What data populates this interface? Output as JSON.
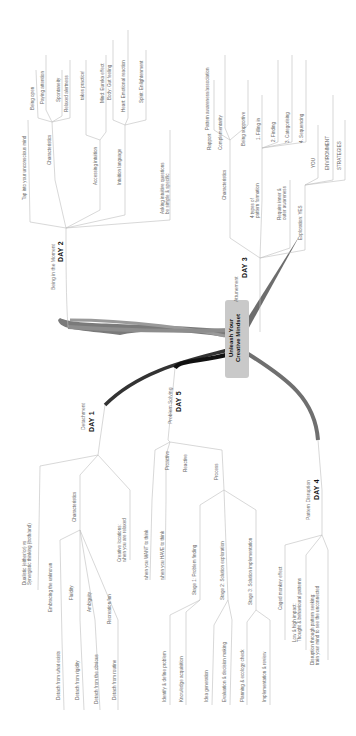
{
  "title": "Unleash Your\nCreative Mindset",
  "colors": {
    "branch_dark": "#222222",
    "branch_mid": "#6b6b6b",
    "line": "#bdbdbd",
    "center_fill": "#c9c9c9"
  },
  "branches": {
    "day2": {
      "day": "DAY 2",
      "topic": "Being in the Moment",
      "children": {
        "tap": "Tap into your unconscious mind",
        "characteristics": "Characteristics",
        "char_items": [
          "Being open",
          "Paying attention",
          "Spontaneity",
          "Relaxed alertness"
        ],
        "accessing": "Accessing intuition",
        "access_items": [
          "takes practice!",
          "Mind: Eureka effect"
        ],
        "language": "Intuition language",
        "lang_items": [
          "Body: Gut feeling",
          "Heart: Emotional reaction",
          "Spirit: Enlightenment"
        ],
        "asking": "Asking intuitive questions\nbe simple & specific"
      }
    },
    "day3": {
      "day": "DAY 3",
      "topic": "Attunement",
      "children": {
        "pattern": "Pattern awareness/association",
        "characteristics": "Characteristics",
        "char_items": [
          "Rapport",
          "Complementarity",
          "Being supportive"
        ],
        "types": "4 types of\npattern formation",
        "type_items": [
          "1. Filling in",
          "2. Finding",
          "3. Categorising",
          "4. Sequencing"
        ],
        "require": "Require inner &\nouter awareness",
        "exploration": "Exploration: YES",
        "explore_items": [
          "YOU",
          "ENVIRONMENT",
          "STRATEGIES"
        ]
      }
    },
    "day1": {
      "day": "DAY 1",
      "topic": "Detachment",
      "children": {
        "dualistic": "Dualistic (either/or) vs\nSynergistic thinking (both/and)",
        "characteristics": "Characteristics",
        "char_items": [
          "Embracing the unknown",
          "Fluidity",
          "Ambiguity",
          "Recreation/fun"
        ],
        "detach_items": [
          "Detach from what exists",
          "Detach from rigidity",
          "Detach from the obvious",
          "Detach from routine"
        ],
        "creative": "Creative locations:\nwhen you are relaxed"
      }
    },
    "day5": {
      "day": "DAY 5",
      "topic": "Problem Solving",
      "children": {
        "proactive": "Proactive",
        "proactive_item": "when you WANT to think",
        "reactive": "Reactive",
        "reactive_item": "when you HAVE to think",
        "process": "Process",
        "stages": [
          "Stage 1: Problem finding",
          "Stage 2: Solution exploration",
          "Stage 3: Solution implementation"
        ],
        "stage1_items": [
          "Identify & define problem",
          "Knowledge acquisition"
        ],
        "stage2_items": [
          "Idea generation",
          "Evaluation & decision making"
        ],
        "stage3_items": [
          "Planning & ecology check",
          "Implementation & review"
        ]
      }
    },
    "day4": {
      "day": "DAY 4",
      "topic": "Pattern Disruption",
      "children": {
        "caged": "Caged monkey effect",
        "low": "Low & high impact:\nThought & behavioural patterns",
        "disruption": "Disruption through pattern seeking:\ntrain your mind to see the unconnected"
      }
    }
  }
}
